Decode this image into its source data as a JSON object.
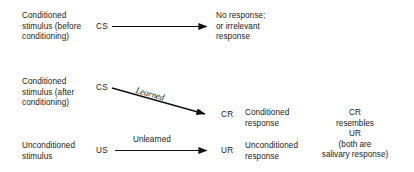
{
  "diagram": {
    "line_color": "#111111",
    "text_color": "#1a1a1a",
    "background": "#ffffff",
    "rows": [
      {
        "id": "before-conditioning",
        "stimulus_label": "Conditioned\nstimulus (before\nconditioning)",
        "stimulus_code": "CS",
        "arrow_label": "",
        "arrow_type": "horizontal",
        "response_code": "",
        "outcome_label": "No response;\nor irrelevant\nresponse"
      },
      {
        "id": "after-conditioning",
        "stimulus_label": "Conditioned\nstimulus (after\nconditioning)",
        "stimulus_code": "CS",
        "arrow_label": "Learned",
        "arrow_type": "diagonal",
        "response_code": "CR",
        "outcome_label": "Conditioned\nresponse"
      },
      {
        "id": "unconditioned",
        "stimulus_label": "Unconditioned\nstimulus",
        "stimulus_code": "US",
        "arrow_label": "Unlearned",
        "arrow_type": "horizontal",
        "response_code": "UR",
        "outcome_label": "Unconditioned\nresponse"
      }
    ],
    "note": "CR\nresembles\nUR\n(both are\nsalivary response)"
  }
}
